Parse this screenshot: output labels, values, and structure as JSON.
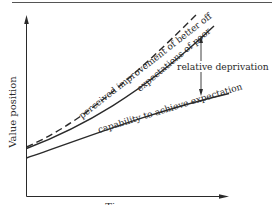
{
  "diagram": {
    "type": "line-concept",
    "title": "",
    "y_axis_label": "Value position",
    "x_axis_label": "Time",
    "curves": [
      {
        "id": "perceived",
        "label": "perceived improvement of better off",
        "style": "dashed"
      },
      {
        "id": "expectations",
        "label": "expectations of poor",
        "style": "solid"
      },
      {
        "id": "capability",
        "label": "capability to achieve expectation",
        "style": "solid"
      }
    ],
    "annotation": {
      "label": "relative deprivation",
      "description": "double-headed arrow between expectations of poor and capability to achieve expectation"
    },
    "colors": {
      "ink": "#2a2a2a",
      "background": "#ffffff"
    }
  }
}
